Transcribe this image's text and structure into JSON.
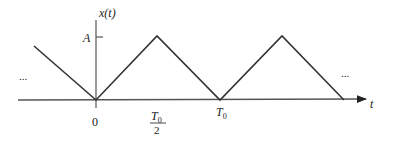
{
  "diagram": {
    "type": "triangle-wave signal plot",
    "y_axis_label": "x(t)",
    "x_axis_label": "t",
    "amplitude_label": "A",
    "ellipsis_left": "...",
    "ellipsis_right": "...",
    "x_ticks": [
      {
        "label": "0"
      },
      {
        "label_num": "T",
        "label_sub": "0",
        "label_den": "2"
      },
      {
        "label": "T",
        "label_sub": "0"
      }
    ],
    "line_color": "#333333"
  }
}
